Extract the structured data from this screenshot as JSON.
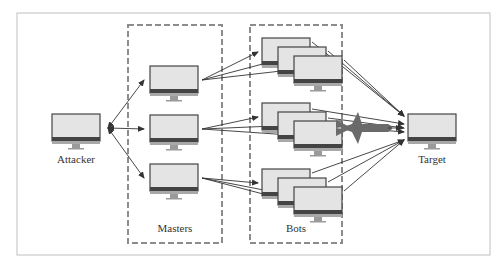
{
  "diagram": {
    "labels": {
      "attacker": "Attacker",
      "masters": "Masters",
      "bots": "Bots",
      "target": "Target"
    },
    "nodes": {
      "attacker": {
        "x": 52,
        "y": 114
      },
      "masters": [
        {
          "x": 150,
          "y": 66
        },
        {
          "x": 150,
          "y": 115
        },
        {
          "x": 150,
          "y": 164
        }
      ],
      "bot_groups": [
        [
          {
            "x": 262,
            "y": 38
          },
          {
            "x": 278,
            "y": 47
          },
          {
            "x": 294,
            "y": 56
          }
        ],
        [
          {
            "x": 262,
            "y": 103
          },
          {
            "x": 278,
            "y": 112
          },
          {
            "x": 294,
            "y": 121
          }
        ],
        [
          {
            "x": 262,
            "y": 169
          },
          {
            "x": 278,
            "y": 178
          },
          {
            "x": 294,
            "y": 187
          }
        ]
      ],
      "target": {
        "x": 408,
        "y": 114
      }
    },
    "colors": {
      "frame": "#b8b8b8",
      "dashed_box": "#8a8a8a",
      "screen": "#e2e2e2",
      "bezel": "#444444",
      "stand": "#9a9a9a",
      "arrow": "#333333",
      "missile": "#6a6a6a"
    }
  }
}
